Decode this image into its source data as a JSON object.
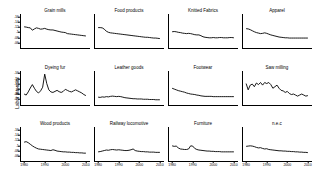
{
  "chart_data": {
    "type": "line",
    "title": "",
    "xlabel": "",
    "ylabel": "Labor intensity",
    "xlim": [
      1978,
      2012
    ],
    "ylim": [
      0.04,
      0.17
    ],
    "xticks": [
      1980,
      1990,
      2000,
      2010
    ],
    "xticklabels": [
      "1980",
      "1990",
      "2000",
      "2010"
    ],
    "yticks": [
      0.06,
      0.08,
      0.1,
      0.12,
      0.14,
      0.16
    ],
    "yticklabels": [
      ".06",
      ".08",
      ".1",
      ".12",
      ".14",
      ".16"
    ],
    "grid": false,
    "legend": "none",
    "layout": {
      "rows": 3,
      "cols": 4
    },
    "panels": [
      {
        "title": "Grain mills",
        "x": [
          1980,
          1981,
          1982,
          1983,
          1984,
          1985,
          1986,
          1987,
          1988,
          1989,
          1990,
          1991,
          1992,
          1993,
          1994,
          1995,
          1996,
          1997,
          1998,
          1999,
          2000,
          2001,
          2002,
          2003,
          2004,
          2005,
          2006,
          2007,
          2008,
          2009,
          2010
        ],
        "values": [
          0.121,
          0.12,
          0.118,
          0.117,
          0.108,
          0.113,
          0.117,
          0.115,
          0.112,
          0.113,
          0.115,
          0.112,
          0.11,
          0.109,
          0.109,
          0.107,
          0.105,
          0.103,
          0.101,
          0.1,
          0.099,
          0.095,
          0.094,
          0.093,
          0.092,
          0.091,
          0.09,
          0.089,
          0.088,
          0.087,
          0.086
        ]
      },
      {
        "title": "Food products",
        "x": [
          1980,
          1981,
          1982,
          1983,
          1984,
          1985,
          1986,
          1987,
          1988,
          1989,
          1990,
          1991,
          1992,
          1993,
          1994,
          1995,
          1996,
          1997,
          1998,
          1999,
          2000,
          2001,
          2002,
          2003,
          2004,
          2005,
          2006,
          2007,
          2008,
          2009,
          2010
        ],
        "values": [
          0.118,
          0.118,
          0.117,
          0.112,
          0.104,
          0.1,
          0.098,
          0.097,
          0.096,
          0.095,
          0.094,
          0.093,
          0.092,
          0.091,
          0.09,
          0.089,
          0.088,
          0.087,
          0.086,
          0.085,
          0.084,
          0.083,
          0.082,
          0.081,
          0.081,
          0.08,
          0.079,
          0.078,
          0.078,
          0.077,
          0.076
        ]
      },
      {
        "title": "Knitted Fabrics",
        "x": [
          1980,
          1981,
          1982,
          1983,
          1984,
          1985,
          1986,
          1987,
          1988,
          1989,
          1990,
          1991,
          1992,
          1993,
          1994,
          1995,
          1996,
          1997,
          1998,
          1999,
          2000,
          2001,
          2002,
          2003,
          2004,
          2005,
          2006,
          2007,
          2008,
          2009,
          2010
        ],
        "values": [
          0.102,
          0.103,
          0.102,
          0.1,
          0.099,
          0.097,
          0.096,
          0.095,
          0.096,
          0.095,
          0.093,
          0.091,
          0.09,
          0.09,
          0.087,
          0.083,
          0.081,
          0.08,
          0.079,
          0.079,
          0.08,
          0.079,
          0.079,
          0.08,
          0.08,
          0.079,
          0.079,
          0.079,
          0.08,
          0.08,
          0.079
        ]
      },
      {
        "title": "Apparel",
        "x": [
          1980,
          1981,
          1982,
          1983,
          1984,
          1985,
          1986,
          1987,
          1988,
          1989,
          1990,
          1991,
          1992,
          1993,
          1994,
          1995,
          1996,
          1997,
          1998,
          1999,
          2000,
          2001,
          2002,
          2003,
          2004,
          2005,
          2006,
          2007,
          2008,
          2009,
          2010
        ],
        "values": [
          0.114,
          0.113,
          0.11,
          0.106,
          0.102,
          0.099,
          0.097,
          0.095,
          0.096,
          0.098,
          0.096,
          0.093,
          0.09,
          0.088,
          0.086,
          0.084,
          0.082,
          0.081,
          0.08,
          0.079,
          0.079,
          0.078,
          0.078,
          0.078,
          0.078,
          0.078,
          0.078,
          0.078,
          0.078,
          0.078,
          0.078
        ]
      },
      {
        "title": "Dyeing fur",
        "x": [
          1980,
          1981,
          1982,
          1983,
          1984,
          1985,
          1986,
          1987,
          1988,
          1989,
          1990,
          1991,
          1992,
          1993,
          1994,
          1995,
          1996,
          1997,
          1998,
          1999,
          2000,
          2001,
          2002,
          2003,
          2004,
          2005,
          2006,
          2007,
          2008,
          2009,
          2010
        ],
        "values": [
          0.082,
          0.078,
          0.09,
          0.105,
          0.118,
          0.104,
          0.092,
          0.086,
          0.094,
          0.108,
          0.158,
          0.122,
          0.098,
          0.09,
          0.088,
          0.092,
          0.096,
          0.091,
          0.088,
          0.092,
          0.1,
          0.096,
          0.092,
          0.09,
          0.094,
          0.098,
          0.094,
          0.09,
          0.086,
          0.08,
          0.076
        ]
      },
      {
        "title": "Leather goods",
        "x": [
          1980,
          1981,
          1982,
          1983,
          1984,
          1985,
          1986,
          1987,
          1988,
          1989,
          1990,
          1991,
          1992,
          1993,
          1994,
          1995,
          1996,
          1997,
          1998,
          1999,
          2000,
          2001,
          2002,
          2003,
          2004,
          2005,
          2006,
          2007,
          2008,
          2009,
          2010
        ],
        "values": [
          0.07,
          0.069,
          0.071,
          0.07,
          0.072,
          0.071,
          0.073,
          0.074,
          0.073,
          0.072,
          0.073,
          0.072,
          0.07,
          0.068,
          0.067,
          0.066,
          0.065,
          0.064,
          0.064,
          0.063,
          0.063,
          0.063,
          0.062,
          0.062,
          0.062,
          0.061,
          0.061,
          0.061,
          0.06,
          0.06,
          0.06
        ]
      },
      {
        "title": "Footwear",
        "x": [
          1980,
          1981,
          1982,
          1983,
          1984,
          1985,
          1986,
          1987,
          1988,
          1989,
          1990,
          1991,
          1992,
          1993,
          1994,
          1995,
          1996,
          1997,
          1998,
          1999,
          2000,
          2001,
          2002,
          2003,
          2004,
          2005,
          2006,
          2007,
          2008,
          2009,
          2010
        ],
        "values": [
          0.104,
          0.101,
          0.098,
          0.095,
          0.093,
          0.091,
          0.089,
          0.086,
          0.084,
          0.082,
          0.081,
          0.08,
          0.078,
          0.077,
          0.075,
          0.074,
          0.073,
          0.073,
          0.073,
          0.073,
          0.072,
          0.072,
          0.072,
          0.072,
          0.072,
          0.072,
          0.072,
          0.072,
          0.072,
          0.072,
          0.072
        ]
      },
      {
        "title": "Saw milling",
        "x": [
          1980,
          1981,
          1982,
          1983,
          1984,
          1985,
          1986,
          1987,
          1988,
          1989,
          1990,
          1991,
          1992,
          1993,
          1994,
          1995,
          1996,
          1997,
          1998,
          1999,
          2000,
          2001,
          2002,
          2003,
          2004,
          2005,
          2006,
          2007,
          2008,
          2009,
          2010
        ],
        "values": [
          0.122,
          0.098,
          0.116,
          0.12,
          0.11,
          0.124,
          0.118,
          0.126,
          0.116,
          0.126,
          0.122,
          0.126,
          0.118,
          0.104,
          0.11,
          0.116,
          0.104,
          0.096,
          0.094,
          0.088,
          0.092,
          0.084,
          0.08,
          0.082,
          0.078,
          0.074,
          0.078,
          0.082,
          0.078,
          0.074,
          0.076
        ]
      },
      {
        "title": "Wood products",
        "x": [
          1980,
          1981,
          1982,
          1983,
          1984,
          1985,
          1986,
          1987,
          1988,
          1989,
          1990,
          1991,
          1992,
          1993,
          1994,
          1995,
          1996,
          1997,
          1998,
          1999,
          2000,
          2001,
          2002,
          2003,
          2004,
          2005,
          2006,
          2007,
          2008,
          2009,
          2010
        ],
        "values": [
          0.112,
          0.114,
          0.11,
          0.104,
          0.098,
          0.093,
          0.089,
          0.086,
          0.085,
          0.084,
          0.083,
          0.082,
          0.081,
          0.08,
          0.083,
          0.081,
          0.078,
          0.077,
          0.076,
          0.075,
          0.075,
          0.074,
          0.074,
          0.073,
          0.073,
          0.072,
          0.072,
          0.071,
          0.071,
          0.07,
          0.07
        ]
      },
      {
        "title": "Railway locomotive",
        "x": [
          1980,
          1981,
          1982,
          1983,
          1984,
          1985,
          1986,
          1987,
          1988,
          1989,
          1990,
          1991,
          1992,
          1993,
          1994,
          1995,
          1996,
          1997,
          1998,
          1999,
          2000,
          2001,
          2002,
          2003,
          2004,
          2005,
          2006,
          2007,
          2008,
          2009,
          2010
        ],
        "values": [
          0.075,
          0.076,
          0.078,
          0.08,
          0.082,
          0.081,
          0.083,
          0.084,
          0.083,
          0.082,
          0.083,
          0.082,
          0.081,
          0.08,
          0.08,
          0.081,
          0.083,
          0.086,
          0.08,
          0.078,
          0.077,
          0.076,
          0.076,
          0.075,
          0.075,
          0.074,
          0.074,
          0.074,
          0.073,
          0.073,
          0.073
        ]
      },
      {
        "title": "Furniture",
        "x": [
          1980,
          1981,
          1982,
          1983,
          1984,
          1985,
          1986,
          1987,
          1988,
          1989,
          1990,
          1991,
          1992,
          1993,
          1994,
          1995,
          1996,
          1997,
          1998,
          1999,
          2000,
          2001,
          2002,
          2003,
          2004,
          2005,
          2006,
          2007,
          2008,
          2009,
          2010
        ],
        "values": [
          0.098,
          0.096,
          0.097,
          0.09,
          0.086,
          0.085,
          0.084,
          0.084,
          0.086,
          0.098,
          0.097,
          0.088,
          0.084,
          0.082,
          0.081,
          0.08,
          0.079,
          0.078,
          0.078,
          0.077,
          0.077,
          0.076,
          0.076,
          0.076,
          0.075,
          0.075,
          0.075,
          0.075,
          0.075,
          0.075,
          0.075
        ]
      },
      {
        "title": "n.e.c",
        "x": [
          1980,
          1981,
          1982,
          1983,
          1984,
          1985,
          1986,
          1987,
          1988,
          1989,
          1990,
          1991,
          1992,
          1993,
          1994,
          1995,
          1996,
          1997,
          1998,
          1999,
          2000,
          2001,
          2002,
          2003,
          2004,
          2005,
          2006,
          2007,
          2008,
          2009,
          2010
        ],
        "values": [
          0.096,
          0.097,
          0.098,
          0.097,
          0.095,
          0.092,
          0.09,
          0.091,
          0.088,
          0.086,
          0.087,
          0.084,
          0.083,
          0.082,
          0.081,
          0.08,
          0.079,
          0.079,
          0.078,
          0.078,
          0.077,
          0.077,
          0.076,
          0.076,
          0.075,
          0.075,
          0.074,
          0.074,
          0.073,
          0.073,
          0.072
        ]
      }
    ]
  }
}
